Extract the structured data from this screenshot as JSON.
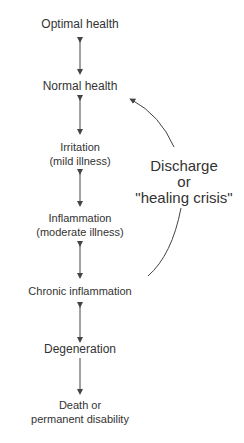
{
  "diagram": {
    "stages": [
      {
        "label": "Optimal health"
      },
      {
        "label": "Normal health"
      },
      {
        "label": "Irritation",
        "sub": "(mild illness)"
      },
      {
        "label": "Inflammation",
        "sub": "(moderate illness)"
      },
      {
        "label": "Chronic inflammation"
      },
      {
        "label": "Degeneration"
      },
      {
        "label": "Death or",
        "sub": "permanent disability"
      }
    ],
    "side_label": {
      "line1": "Discharge",
      "line2": "or",
      "line3": "\"healing crisis\""
    },
    "colors": {
      "text": "#333333",
      "arrow": "#444444",
      "background": "#ffffff"
    }
  }
}
